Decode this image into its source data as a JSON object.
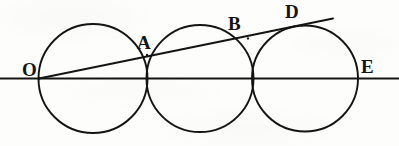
{
  "figure": {
    "width": 399,
    "height": 146,
    "background_color": "#fdfdfc",
    "ink_color": "#141414"
  },
  "geometry": {
    "baseline": {
      "name": "baseline-OE",
      "x1": 0,
      "y1": 78.5,
      "x2": 399,
      "y2": 78.5,
      "stroke_width": 1.9
    },
    "secant": {
      "name": "secant-line-O-to-D",
      "x1": 39,
      "y1": 78.5,
      "x2": 333,
      "y2": 18.5,
      "stroke_width": 1.9
    },
    "circles": [
      {
        "name": "circle-left",
        "cx": 93,
        "cy": 78.5,
        "r": 54.5,
        "stroke_width": 1.9
      },
      {
        "name": "circle-middle",
        "cx": 200,
        "cy": 78.5,
        "r": 53.5,
        "stroke_width": 1.9
      },
      {
        "name": "circle-right",
        "cx": 305,
        "cy": 78.5,
        "r": 53.0,
        "stroke_width": 1.9
      }
    ],
    "marked_points": [
      {
        "name": "point-O",
        "x": 39,
        "y": 78.5
      },
      {
        "name": "point-A",
        "x": 147,
        "y": 55.0
      },
      {
        "name": "point-B",
        "x": 248,
        "y": 38.5
      },
      {
        "name": "point-D",
        "x": 302,
        "y": 25.5
      },
      {
        "name": "point-E",
        "x": 358,
        "y": 78.5
      }
    ]
  },
  "labels": [
    {
      "id": "O",
      "text": "O",
      "x": 22,
      "y": 60,
      "font_size": 19
    },
    {
      "id": "A",
      "text": "A",
      "x": 137,
      "y": 33,
      "font_size": 19
    },
    {
      "id": "B",
      "text": "B",
      "x": 228,
      "y": 14,
      "font_size": 19
    },
    {
      "id": "D",
      "text": "D",
      "x": 285,
      "y": 2,
      "font_size": 19
    },
    {
      "id": "E",
      "text": "E",
      "x": 361,
      "y": 57,
      "font_size": 19
    }
  ]
}
